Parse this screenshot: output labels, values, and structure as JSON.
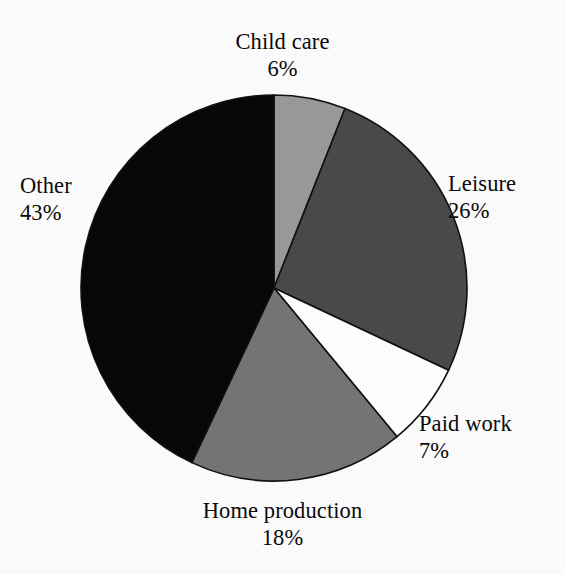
{
  "chart_data": {
    "type": "pie",
    "title": "",
    "subtitle": "",
    "xlabel": "",
    "ylabel": "",
    "legend_position": "none",
    "grid": false,
    "start_angle_deg": 0,
    "direction": "clockwise",
    "center": {
      "x": 274,
      "y": 288
    },
    "radius": 193,
    "categories": [
      "Child care",
      "Leisure",
      "Paid work",
      "Home production",
      "Other"
    ],
    "values": [
      6,
      26,
      7,
      18,
      43
    ],
    "value_unit": "%",
    "slices": [
      {
        "label": "Child care",
        "value": 6,
        "value_text": "6%",
        "color": "#9a9a9a",
        "start_deg": 0,
        "end_deg": 21.6,
        "label_position": "top"
      },
      {
        "label": "Leisure",
        "value": 26,
        "value_text": "26%",
        "color": "#4a4a4a",
        "start_deg": 21.6,
        "end_deg": 115.2,
        "label_position": "right"
      },
      {
        "label": "Paid work",
        "value": 7,
        "value_text": "7%",
        "color": "#ffffff",
        "start_deg": 115.2,
        "end_deg": 140.4,
        "label_position": "bottom-right"
      },
      {
        "label": "Home production",
        "value": 18,
        "value_text": "18%",
        "color": "#757575",
        "start_deg": 140.4,
        "end_deg": 205.2,
        "label_position": "bottom"
      },
      {
        "label": "Other",
        "value": 43,
        "value_text": "43%",
        "color": "#080808",
        "start_deg": 205.2,
        "end_deg": 360,
        "label_position": "left"
      }
    ]
  },
  "colors": {
    "background": "#fdfdfd",
    "outline": "#111111",
    "text": "#0b0b0b"
  }
}
